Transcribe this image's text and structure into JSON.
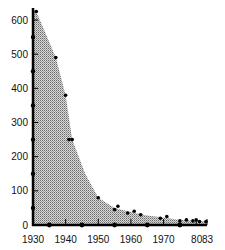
{
  "chart_data": {
    "type": "area",
    "title": "",
    "xlabel": "",
    "ylabel": "",
    "xlim": [
      1930,
      1983
    ],
    "ylim": [
      0,
      600
    ],
    "grid": false,
    "legend": null,
    "fill": "stippled gray",
    "x_ticks": [
      {
        "value": 1930,
        "label": "1930"
      },
      {
        "value": 1940,
        "label": "1940"
      },
      {
        "value": 1950,
        "label": "1950"
      },
      {
        "value": 1960,
        "label": "1960"
      },
      {
        "value": 1970,
        "label": "1970"
      },
      {
        "value": 1980,
        "label": "80"
      },
      {
        "value": 1983,
        "label": "83"
      }
    ],
    "y_ticks": [
      {
        "value": 0,
        "label": "0"
      },
      {
        "value": 100,
        "label": "100"
      },
      {
        "value": 200,
        "label": "200"
      },
      {
        "value": 300,
        "label": "300"
      },
      {
        "value": 400,
        "label": "400"
      },
      {
        "value": 500,
        "label": "500"
      },
      {
        "value": 600,
        "label": "600"
      }
    ],
    "series": [
      {
        "name": "values",
        "points": [
          {
            "x": 1931,
            "y": 625
          },
          {
            "x": 1937,
            "y": 490
          },
          {
            "x": 1940,
            "y": 380
          },
          {
            "x": 1941,
            "y": 250
          },
          {
            "x": 1942,
            "y": 250
          },
          {
            "x": 1950,
            "y": 80
          },
          {
            "x": 1955,
            "y": 45
          },
          {
            "x": 1956,
            "y": 55
          },
          {
            "x": 1959,
            "y": 35
          },
          {
            "x": 1961,
            "y": 40
          },
          {
            "x": 1963,
            "y": 30
          },
          {
            "x": 1969,
            "y": 20
          },
          {
            "x": 1971,
            "y": 25
          },
          {
            "x": 1975,
            "y": 12
          },
          {
            "x": 1977,
            "y": 15
          },
          {
            "x": 1979,
            "y": 12
          },
          {
            "x": 1980,
            "y": 15
          },
          {
            "x": 1981,
            "y": 10
          },
          {
            "x": 1983,
            "y": 10
          }
        ]
      }
    ],
    "envelope": [
      {
        "x": 1930,
        "y": 630
      },
      {
        "x": 1931,
        "y": 625
      },
      {
        "x": 1937,
        "y": 490
      },
      {
        "x": 1940,
        "y": 380
      },
      {
        "x": 1942,
        "y": 250
      },
      {
        "x": 1946,
        "y": 150
      },
      {
        "x": 1950,
        "y": 80
      },
      {
        "x": 1955,
        "y": 50
      },
      {
        "x": 1960,
        "y": 38
      },
      {
        "x": 1965,
        "y": 28
      },
      {
        "x": 1970,
        "y": 22
      },
      {
        "x": 1975,
        "y": 15
      },
      {
        "x": 1980,
        "y": 13
      },
      {
        "x": 1983,
        "y": 10
      }
    ],
    "baseline_markers": [
      1935,
      1945,
      1955,
      1965,
      1975
    ],
    "axis_markers_y": [
      50,
      150,
      250,
      350,
      450,
      550
    ]
  }
}
